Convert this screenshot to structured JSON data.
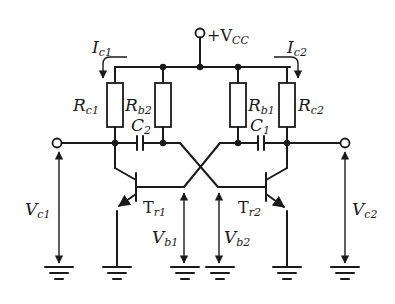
{
  "diagram": {
    "type": "astable-multivibrator-circuit",
    "supply": {
      "label": "+V",
      "sub": "CC"
    },
    "currents": [
      {
        "label": "I",
        "sub": "c1"
      },
      {
        "label": "I",
        "sub": "c2"
      }
    ],
    "resistors": [
      {
        "label": "R",
        "sub": "c1"
      },
      {
        "label": "R",
        "sub": "b2"
      },
      {
        "label": "R",
        "sub": "b1"
      },
      {
        "label": "R",
        "sub": "c2"
      }
    ],
    "capacitors": [
      {
        "label": "C",
        "sub": "2"
      },
      {
        "label": "C",
        "sub": "1"
      }
    ],
    "transistors": [
      {
        "label": "T",
        "sub": "r1"
      },
      {
        "label": "T",
        "sub": "r2"
      }
    ],
    "voltages": [
      {
        "label": "V",
        "sub": "c1"
      },
      {
        "label": "V",
        "sub": "b1"
      },
      {
        "label": "V",
        "sub": "b2"
      },
      {
        "label": "V",
        "sub": "c2"
      }
    ],
    "colors": {
      "line": "#1a1a1a",
      "background": "#ffffff"
    }
  }
}
